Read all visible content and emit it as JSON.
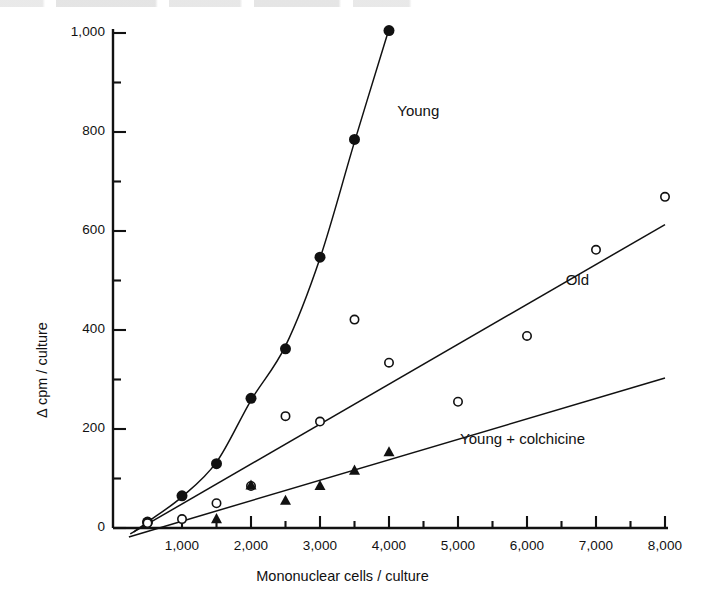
{
  "figure": {
    "title": "",
    "background": "#ffffff",
    "ink_color": "#111111"
  },
  "axes": {
    "x_title": "Mononuclear cells / culture",
    "y_title": "Δ cpm / culture",
    "x_ticks": [
      "1,000",
      "2,000",
      "3,000",
      "4,000",
      "5,000",
      "6,000",
      "7,000",
      "8,000"
    ],
    "y_ticks": [
      "0",
      "200",
      "400",
      "600",
      "800",
      "1,000"
    ]
  },
  "labels": {
    "young": "Young",
    "old": "Old",
    "young_colchicine": "Young + colchicine"
  },
  "chart_data": {
    "type": "scatter",
    "title": "",
    "xlabel": "Mononuclear cells / culture",
    "ylabel": "Δ cpm / culture",
    "xlim": [
      0,
      8000
    ],
    "ylim": [
      0,
      1000
    ],
    "xticks": [
      1000,
      2000,
      3000,
      4000,
      5000,
      6000,
      7000,
      8000
    ],
    "yticks": [
      0,
      200,
      400,
      600,
      800,
      1000
    ],
    "x_minor_tick_step": 500,
    "y_minor_tick_step": 100,
    "grid": false,
    "legend_position": "inline-annotations",
    "series": [
      {
        "name": "Young",
        "marker": "filled-circle",
        "marker_size": 11,
        "color": "#111111",
        "fit": "curve",
        "points": [
          {
            "x": 500,
            "y": 12
          },
          {
            "x": 1000,
            "y": 65
          },
          {
            "x": 1500,
            "y": 130
          },
          {
            "x": 2000,
            "y": 262
          },
          {
            "x": 2500,
            "y": 362
          },
          {
            "x": 3000,
            "y": 547
          },
          {
            "x": 3500,
            "y": 785
          },
          {
            "x": 4000,
            "y": 1005
          }
        ],
        "fit_points": [
          {
            "x": 300,
            "y": -8
          },
          {
            "x": 500,
            "y": 12
          },
          {
            "x": 1000,
            "y": 63
          },
          {
            "x": 1500,
            "y": 133
          },
          {
            "x": 2000,
            "y": 258
          },
          {
            "x": 2500,
            "y": 368
          },
          {
            "x": 3000,
            "y": 545
          },
          {
            "x": 3500,
            "y": 780
          },
          {
            "x": 4000,
            "y": 1008
          }
        ]
      },
      {
        "name": "Old",
        "marker": "open-circle",
        "marker_size": 10,
        "color": "#111111",
        "fit": "line",
        "points": [
          {
            "x": 500,
            "y": 10
          },
          {
            "x": 1000,
            "y": 18
          },
          {
            "x": 1500,
            "y": 50
          },
          {
            "x": 2000,
            "y": 85
          },
          {
            "x": 2500,
            "y": 226
          },
          {
            "x": 3000,
            "y": 215
          },
          {
            "x": 3500,
            "y": 421
          },
          {
            "x": 4000,
            "y": 334
          },
          {
            "x": 5000,
            "y": 255
          },
          {
            "x": 6000,
            "y": 388
          },
          {
            "x": 7000,
            "y": 562
          },
          {
            "x": 8000,
            "y": 669
          }
        ],
        "fit_line": {
          "x0": 250,
          "y0": -12,
          "x1": 8000,
          "y1": 613
        }
      },
      {
        "name": "Young + colchicine",
        "marker": "filled-triangle",
        "marker_size": 11,
        "color": "#111111",
        "fit": "line",
        "points": [
          {
            "x": 1500,
            "y": 20
          },
          {
            "x": 2000,
            "y": 88
          },
          {
            "x": 2500,
            "y": 57
          },
          {
            "x": 3000,
            "y": 87
          },
          {
            "x": 3500,
            "y": 118
          },
          {
            "x": 4000,
            "y": 155
          }
        ],
        "fit_line": {
          "x0": 230,
          "y0": -18,
          "x1": 8000,
          "y1": 303
        }
      }
    ],
    "annotations": [
      {
        "text": "Young",
        "x": 4120,
        "y": 840
      },
      {
        "text": "Old",
        "x": 6560,
        "y": 500
      },
      {
        "text": "Young + colchicine",
        "x": 5030,
        "y": 178
      }
    ]
  }
}
